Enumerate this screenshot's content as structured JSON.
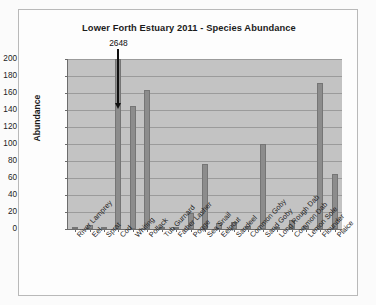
{
  "chart_data": {
    "type": "bar",
    "title": "Lower Forth Estuary 2011 - Species Abundance",
    "xlabel": "",
    "ylabel": "Abundance",
    "ylim": [
      0,
      200
    ],
    "ytick_step": 20,
    "yticks": [
      200,
      180,
      160,
      140,
      120,
      100,
      80,
      60,
      40,
      20,
      0
    ],
    "grid": true,
    "legend": "none",
    "categories": [
      "River Lamprey",
      "Eel",
      "Sprat",
      "Cod",
      "Whiting",
      "Pollack",
      "Tub Gurnard",
      "Father Lasher",
      "Pogge",
      "Sea Snail",
      "Eelpout",
      "Sandeel",
      "Common Goby",
      "Sand Goby",
      "Long Rough Dab",
      "Common Dab",
      "Lemon Sole",
      "Flounder",
      "Plaice"
    ],
    "values": [
      1,
      5,
      1,
      2648,
      145,
      163,
      1,
      2,
      19,
      77,
      7,
      8,
      3,
      100,
      2,
      11,
      3,
      172,
      65
    ],
    "annotations": [
      {
        "text": "2648",
        "category": "Cod",
        "note": "bar truncated at axis maximum; true value shown above arrow",
        "arrow": "down"
      }
    ],
    "bar_color": "#8c8c8c",
    "plot_background": "#c3c3c3",
    "gridline_color": "#9b9b9b"
  }
}
